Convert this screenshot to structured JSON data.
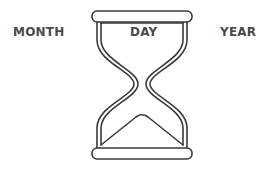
{
  "labels": {
    "month": "MONTH",
    "day": "DAY",
    "year": "YEAR"
  },
  "icon": {
    "name": "hourglass-icon",
    "stroke_color": "#3a3a3a"
  }
}
